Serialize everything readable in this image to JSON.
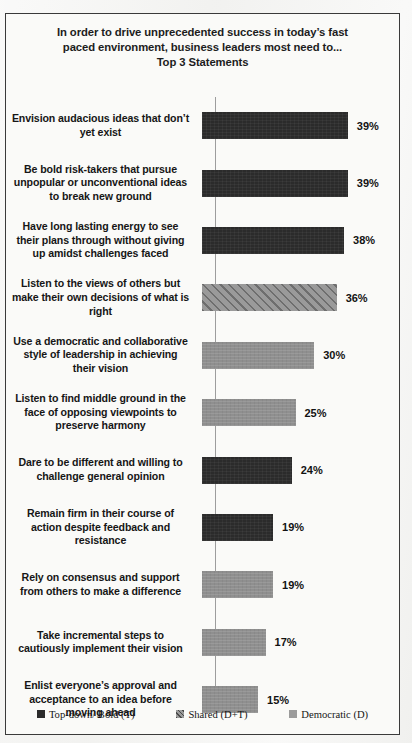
{
  "chart_data": {
    "type": "bar",
    "orientation": "horizontal",
    "title_lines": [
      "In order to drive unprecedented success in today’s fast",
      "paced environment, business leaders most need to...",
      "Top 3 Statements"
    ],
    "xlabel": "",
    "ylabel": "",
    "xlim": [
      0,
      45
    ],
    "grid": false,
    "legend_position": "bottom",
    "categories": [
      "Envision audacious ideas that don’t yet exist",
      "Be bold risk-takers  that pursue unpopular or unconventional ideas to break new ground",
      "Have long lasting energy to see their plans through without giving up amidst challenges faced",
      "Listen to the views of others but make their own decisions of what is right",
      "Use a democratic and collaborative style of leadership  in achieving their vision",
      "Listen to find middle ground in the face of opposing viewpoints  to preserve harmony",
      "Dare to be different and willing to challenge  general opinion",
      "Remain firm in their course of action despite feedback and resistance",
      "Rely on consensus and support from others to make a difference",
      "Take incremental steps to cautiously implement their vision",
      "Enlist everyone’s approval and acceptance to an idea before moving ahead"
    ],
    "values": [
      39,
      39,
      38,
      36,
      30,
      25,
      24,
      19,
      19,
      17,
      15
    ],
    "value_labels": [
      "39%",
      "39%",
      "38%",
      "36%",
      "30%",
      "25%",
      "24%",
      "19%",
      "19%",
      "17%",
      "15%"
    ],
    "series_of_bar": [
      "dark",
      "dark",
      "dark",
      "hatch",
      "gray",
      "gray",
      "dark",
      "dark",
      "gray",
      "gray",
      "gray"
    ],
    "bars": [
      {
        "label_lines": [
          "Envision audacious ideas that don’t",
          "yet exist"
        ],
        "value": 39,
        "value_label": "39%",
        "style": "dark"
      },
      {
        "label_lines": [
          "Be bold risk-takers  that pursue",
          "unpopular or unconventional ideas",
          "to break new ground"
        ],
        "value": 39,
        "value_label": "39%",
        "style": "dark"
      },
      {
        "label_lines": [
          "Have long lasting energy to see",
          "their plans through without giving",
          "up amidst challenges faced"
        ],
        "value": 38,
        "value_label": "38%",
        "style": "dark"
      },
      {
        "label_lines": [
          "Listen to the views of others but",
          "make their own decisions of what is",
          "right"
        ],
        "value": 36,
        "value_label": "36%",
        "style": "hatch"
      },
      {
        "label_lines": [
          "Use a democratic and collaborative",
          "style of leadership  in achieving",
          "their vision"
        ],
        "value": 30,
        "value_label": "30%",
        "style": "gray"
      },
      {
        "label_lines": [
          "Listen to find middle ground in the",
          "face of opposing viewpoints  to",
          "preserve harmony"
        ],
        "value": 25,
        "value_label": "25%",
        "style": "gray"
      },
      {
        "label_lines": [
          "Dare to be different and willing to",
          "challenge  general opinion"
        ],
        "value": 24,
        "value_label": "24%",
        "style": "dark"
      },
      {
        "label_lines": [
          "Remain firm in their course of",
          "action despite feedback and",
          "resistance"
        ],
        "value": 19,
        "value_label": "19%",
        "style": "dark"
      },
      {
        "label_lines": [
          "Rely on consensus and support",
          "from others to make a difference"
        ],
        "value": 19,
        "value_label": "19%",
        "style": "gray"
      },
      {
        "label_lines": [
          "Take incremental steps to",
          "cautiously implement their vision"
        ],
        "value": 17,
        "value_label": "17%",
        "style": "gray"
      },
      {
        "label_lines": [
          "Enlist everyone’s approval and",
          "acceptance to an idea before",
          "moving ahead"
        ],
        "value": 15,
        "value_label": "15%",
        "style": "gray"
      }
    ],
    "legend": [
      {
        "label": "Top-down/ Bold (T)",
        "style": "dark",
        "color": "#2b2b2b"
      },
      {
        "label": "Shared (D+T)",
        "style": "hatch",
        "color": "#9a9a9a"
      },
      {
        "label": "Democratic (D)",
        "style": "gray",
        "color": "#9b9b9b"
      }
    ],
    "px_per_percent": 3.74
  }
}
